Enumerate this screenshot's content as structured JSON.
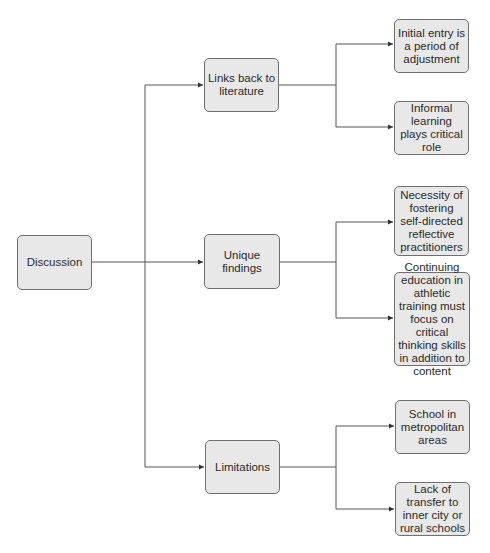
{
  "diagram": {
    "root": {
      "label": "Discussion"
    },
    "branches": [
      {
        "label": "Links back to literature",
        "children": [
          {
            "label": "Initial entry is a period of adjustment"
          },
          {
            "label": "Informal learning plays critical role"
          }
        ]
      },
      {
        "label": "Unique findings",
        "children": [
          {
            "label": "Necessity of fostering self-directed reflective practitioners"
          },
          {
            "label": "Continuing education in athletic training must focus on critical thinking skills in addition to content"
          }
        ]
      },
      {
        "label": "Limitations",
        "children": [
          {
            "label": "School in metropolitan areas"
          },
          {
            "label": "Lack of transfer to inner city or rural schools"
          }
        ]
      }
    ]
  },
  "colors": {
    "box_fill": "#e8e8e8",
    "box_border": "#6f6f6f",
    "line": "#555555"
  }
}
